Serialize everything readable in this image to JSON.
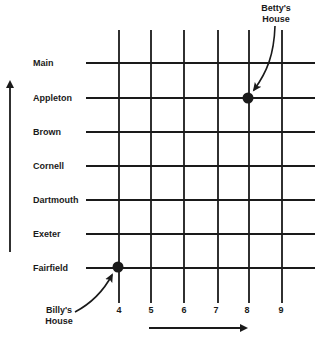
{
  "diagram": {
    "type": "street-grid-map",
    "streets": [
      {
        "name": "Main",
        "y": 63
      },
      {
        "name": "Appleton",
        "y": 98
      },
      {
        "name": "Brown",
        "y": 132
      },
      {
        "name": "Cornell",
        "y": 166
      },
      {
        "name": "Dartmouth",
        "y": 200
      },
      {
        "name": "Exeter",
        "y": 234
      },
      {
        "name": "Fairfield",
        "y": 268
      }
    ],
    "avenues": [
      {
        "name": "4",
        "x": 119
      },
      {
        "name": "5",
        "x": 151
      },
      {
        "name": "6",
        "x": 184
      },
      {
        "name": "7",
        "x": 218
      },
      {
        "name": "8",
        "x": 249
      },
      {
        "name": "9",
        "x": 282
      }
    ],
    "houses": [
      {
        "label_line1": "Betty's",
        "label_line2": "House",
        "street": "Appleton",
        "avenue": "8"
      },
      {
        "label_line1": "Billy's",
        "label_line2": "House",
        "street": "Fairfield",
        "avenue": "4"
      }
    ],
    "line_color": "#1a1a1a",
    "background": "#ffffff"
  }
}
